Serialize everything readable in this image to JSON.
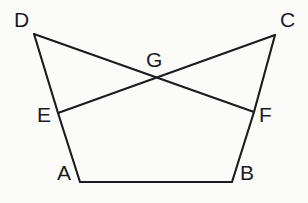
{
  "figure": {
    "background_color": "#fbfbfa",
    "line_color": "#1b1b1f",
    "line_width": 2.1,
    "width": 308,
    "height": 203,
    "points": {
      "D": {
        "label": "D",
        "x": 34,
        "y": 34,
        "label_x": 14,
        "label_y": 9
      },
      "C": {
        "label": "C",
        "x": 275,
        "y": 35,
        "label_x": 280,
        "label_y": 9
      },
      "E": {
        "label": "E",
        "x": 58,
        "y": 113,
        "label_x": 37,
        "label_y": 104
      },
      "F": {
        "label": "F",
        "x": 254,
        "y": 112,
        "label_x": 259,
        "label_y": 104
      },
      "A": {
        "label": "A",
        "x": 80,
        "y": 182,
        "label_x": 57,
        "label_y": 162
      },
      "B": {
        "label": "B",
        "x": 232,
        "y": 182,
        "label_x": 240,
        "label_y": 162
      },
      "G": {
        "label": "G",
        "x": 158,
        "y": 79,
        "label_x": 146,
        "label_y": 49
      }
    },
    "segments": [
      {
        "name": "side-D-E-A",
        "path": "M 34 34 L 58 113 L 80 182",
        "endpoints": [
          "D",
          "E",
          "A"
        ]
      },
      {
        "name": "side-C-F-B",
        "path": "M 275 35 L 254 112 L 232 182",
        "endpoints": [
          "C",
          "F",
          "B"
        ]
      },
      {
        "name": "base-A-B",
        "path": "M 80 182 L 232 182",
        "endpoints": [
          "A",
          "B"
        ]
      },
      {
        "name": "diagonal-D-F",
        "path": "M 34 34 L 254 112",
        "endpoints": [
          "D",
          "F"
        ]
      },
      {
        "name": "diagonal-E-C",
        "path": "M 58 113 L 275 35",
        "endpoints": [
          "E",
          "C"
        ]
      }
    ],
    "intersection": {
      "name": "G",
      "of": [
        "diagonal-D-F",
        "diagonal-E-C"
      ],
      "x": 158,
      "y": 79
    }
  }
}
